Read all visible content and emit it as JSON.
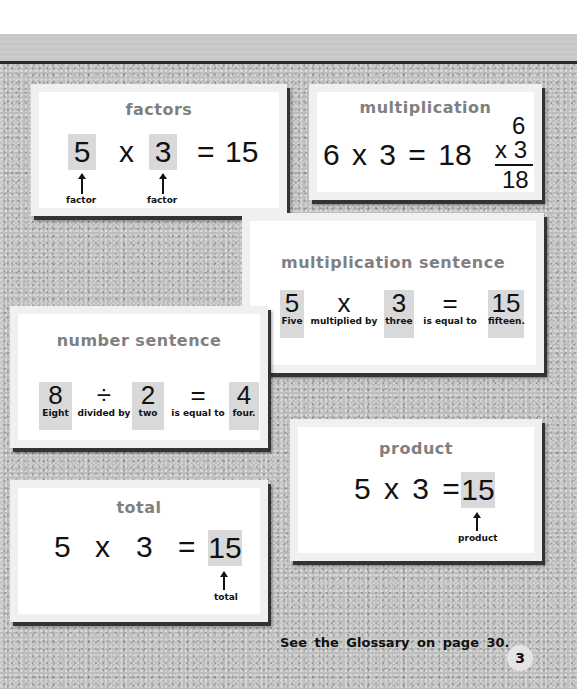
{
  "page": {
    "footer": "See the Glossary on page 30.",
    "page_number": "3"
  },
  "cards": {
    "factors": {
      "title": "factors",
      "a": "5",
      "op": "x",
      "b": "3",
      "eq": "=",
      "result": "15",
      "label_a": "factor",
      "label_b": "factor"
    },
    "multiplication": {
      "title": "multiplication",
      "equation": "6 x 3 = 18",
      "vertical_top": "6",
      "vertical_mid": "x 3",
      "vertical_result": "18"
    },
    "multiplication_sentence": {
      "title": "multiplication sentence",
      "tiles": [
        {
          "num": "5",
          "word": "Five",
          "highlight": true
        },
        {
          "num": "x",
          "word": "multiplied by",
          "highlight": false
        },
        {
          "num": "3",
          "word": "three",
          "highlight": true
        },
        {
          "num": "=",
          "word": "is equal to",
          "highlight": false
        },
        {
          "num": "15",
          "word": "fifteen.",
          "highlight": true
        }
      ]
    },
    "number_sentence": {
      "title": "number sentence",
      "tiles": [
        {
          "num": "8",
          "word": "Eight",
          "highlight": true
        },
        {
          "num": "÷",
          "word": "divided by",
          "highlight": false
        },
        {
          "num": "2",
          "word": "two",
          "highlight": true
        },
        {
          "num": "=",
          "word": "is equal to",
          "highlight": false
        },
        {
          "num": "4",
          "word": "four.",
          "highlight": true
        }
      ]
    },
    "product": {
      "title": "product",
      "equation": "5 x 3 =",
      "result": "15",
      "label": "product"
    },
    "total": {
      "title": "total",
      "a": "5",
      "op": "x",
      "b": "3",
      "eq": "=",
      "result": "15",
      "label": "total"
    }
  }
}
